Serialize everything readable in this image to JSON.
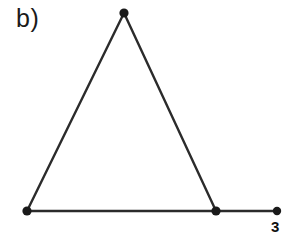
{
  "figure": {
    "panel_label": "b)",
    "background_color": "#ffffff",
    "stroke_color": "#2b2b2b",
    "vertex_color": "#1a1a1a",
    "width": 295,
    "height": 235
  },
  "chart_data": {
    "type": "diagram",
    "title": "b)",
    "subtitle": "",
    "xlabel": "",
    "ylabel": "",
    "grid": false,
    "legend": null,
    "nodes": [
      {
        "id": "apex",
        "label": "",
        "x": 124,
        "y": 13,
        "degree": 2
      },
      {
        "id": "base-left",
        "label": "",
        "x": 27,
        "y": 211,
        "degree": 2
      },
      {
        "id": "base-right",
        "label": "",
        "x": 216,
        "y": 211,
        "degree": 3
      },
      {
        "id": "pendant",
        "label": "3",
        "x": 277,
        "y": 211,
        "degree": 1
      }
    ],
    "edges": [
      {
        "from": "base-left",
        "to": "apex"
      },
      {
        "from": "apex",
        "to": "base-right"
      },
      {
        "from": "base-left",
        "to": "base-right"
      },
      {
        "from": "base-right",
        "to": "pendant"
      }
    ],
    "annotations": [
      {
        "id": "panel-label",
        "text": "b)",
        "x": 18,
        "y": 24
      },
      {
        "id": "pendant-label",
        "text": "3",
        "x": 277,
        "y": 227
      }
    ]
  }
}
